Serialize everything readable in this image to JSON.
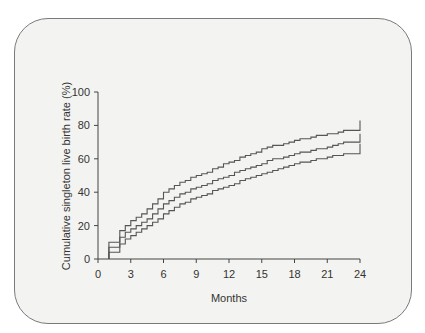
{
  "chart_data": {
    "type": "line",
    "subtype": "step",
    "title": "",
    "xlabel": "Months",
    "ylabel": "Cumulative singleton live birth rate (%)",
    "xlim": [
      0,
      24
    ],
    "ylim": [
      0,
      100
    ],
    "xticks": [
      0,
      3,
      6,
      9,
      12,
      15,
      18,
      21,
      24
    ],
    "yticks": [
      0,
      20,
      40,
      60,
      80,
      100
    ],
    "grid": false,
    "legend": null,
    "x": [
      1,
      1.5,
      2,
      2.5,
      3,
      3.5,
      4,
      4.5,
      5,
      5.5,
      6,
      6.5,
      7,
      7.5,
      8,
      8.5,
      9,
      9.5,
      10,
      10.5,
      11,
      11.5,
      12,
      12.5,
      13,
      13.5,
      14,
      14.5,
      15,
      15.5,
      16,
      16.5,
      17,
      17.5,
      18,
      18.5,
      19,
      19.5,
      20,
      20.5,
      21,
      21.5,
      22,
      22.5,
      23,
      23.5,
      24
    ],
    "series": [
      {
        "name": "Upper 95% CI",
        "values": [
          10,
          10,
          17,
          20,
          23,
          25,
          27,
          30,
          33,
          36,
          40,
          42,
          44,
          46,
          47,
          49,
          50,
          51,
          52,
          54,
          55,
          57,
          58,
          59,
          61,
          62,
          63,
          64,
          66,
          67,
          68,
          68,
          69,
          70,
          71,
          72,
          72,
          73,
          74,
          74,
          75,
          75,
          76,
          77,
          77,
          77,
          83
        ]
      },
      {
        "name": "Cumulative live birth rate",
        "values": [
          7,
          7,
          13,
          16,
          18,
          20,
          22,
          24,
          27,
          30,
          33,
          35,
          37,
          39,
          40,
          42,
          43,
          44,
          45,
          47,
          48,
          49,
          50,
          52,
          53,
          54,
          55,
          56,
          57,
          59,
          60,
          60,
          61,
          62,
          63,
          64,
          64,
          65,
          66,
          66,
          67,
          68,
          69,
          70,
          70,
          70,
          75
        ]
      },
      {
        "name": "Lower 95% CI",
        "values": [
          4,
          4,
          9,
          12,
          14,
          16,
          18,
          20,
          22,
          24,
          27,
          29,
          31,
          33,
          34,
          36,
          37,
          38,
          39,
          41,
          42,
          43,
          44,
          45,
          47,
          48,
          49,
          50,
          51,
          52,
          53,
          54,
          55,
          56,
          57,
          58,
          58,
          59,
          60,
          60,
          61,
          62,
          62,
          63,
          63,
          63,
          69
        ]
      }
    ],
    "end_plateaus": {
      "upper": 77,
      "middle": 70,
      "lower": 63
    }
  },
  "axes": {
    "x_title": "Months",
    "y_title": "Cumulative singleton live birth rate (%)",
    "x_tick_labels": [
      "0",
      "3",
      "6",
      "9",
      "12",
      "15",
      "18",
      "21",
      "24"
    ],
    "y_tick_labels": [
      "0",
      "20",
      "40",
      "60",
      "80",
      "100"
    ]
  },
  "colors": {
    "line": "#555555",
    "axis": "#444444",
    "panel_bg": "#f3f3f1",
    "panel_border": "#7a7a7a"
  }
}
